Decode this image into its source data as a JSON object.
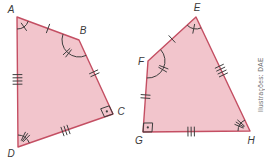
{
  "canvas": {
    "width": 265,
    "height": 164,
    "background": "#ffffff"
  },
  "credit": {
    "text": "Ilustrações: DAE"
  },
  "colors": {
    "shape_fill": "#f2c5cc",
    "shape_stroke": "#c44f63",
    "mark": "#3d3d3d",
    "label": "#3a3a3a",
    "credit": "#6b6b6b"
  },
  "shapes": [
    {
      "id": "quadrilateral-ABCD",
      "vertices": [
        {
          "label": "A",
          "x": 17,
          "y": 17,
          "lx": 11,
          "ly": 13
        },
        {
          "label": "B",
          "x": 79,
          "y": 40,
          "lx": 83,
          "ly": 34
        },
        {
          "label": "C",
          "x": 113,
          "y": 114,
          "lx": 121,
          "ly": 115
        },
        {
          "label": "D",
          "x": 18,
          "y": 147,
          "lx": 11,
          "ly": 157
        }
      ],
      "side_marks": [
        {
          "side": "AB",
          "from": 0,
          "to": 1,
          "ticks": 1,
          "t": 0.5
        },
        {
          "side": "BC",
          "from": 1,
          "to": 2,
          "ticks": 2,
          "t": 0.45
        },
        {
          "side": "CD",
          "from": 2,
          "to": 3,
          "ticks": 3,
          "t": 0.5
        },
        {
          "side": "DA",
          "from": 3,
          "to": 0,
          "ticks": 4,
          "t": 0.52
        }
      ],
      "angle_marks": [
        {
          "at": "A",
          "vertex": 0,
          "type": "arc",
          "radius": 12,
          "start": 20,
          "end": 90,
          "ticks": 1
        },
        {
          "at": "B",
          "vertex": 1,
          "type": "arc",
          "radius": 17,
          "start": 65,
          "end": 200,
          "ticks": 2
        },
        {
          "at": "C",
          "vertex": 2,
          "type": "right-angle",
          "size": 9,
          "dir1": 245,
          "dir2": 161
        },
        {
          "at": "D",
          "vertex": 3,
          "type": "arc",
          "radius": 12,
          "start": 270,
          "end": 341,
          "ticks": 3
        }
      ]
    },
    {
      "id": "quadrilateral-EFGH",
      "vertices": [
        {
          "label": "E",
          "x": 196,
          "y": 17,
          "lx": 197,
          "ly": 11
        },
        {
          "label": "F",
          "x": 148,
          "y": 61,
          "lx": 141,
          "ly": 65
        },
        {
          "label": "G",
          "x": 143,
          "y": 132,
          "lx": 139,
          "ly": 144
        },
        {
          "label": "H",
          "x": 250,
          "y": 131,
          "lx": 251,
          "ly": 144
        }
      ],
      "side_marks": [
        {
          "side": "EF",
          "from": 0,
          "to": 1,
          "ticks": 1,
          "t": 0.5
        },
        {
          "side": "FG",
          "from": 1,
          "to": 2,
          "ticks": 2,
          "t": 0.5
        },
        {
          "side": "GH",
          "from": 2,
          "to": 3,
          "ticks": 3,
          "t": 0.45
        },
        {
          "side": "EH",
          "from": 0,
          "to": 3,
          "ticks": 4,
          "t": 0.47
        }
      ],
      "angle_marks": [
        {
          "at": "E",
          "vertex": 0,
          "type": "arc",
          "radius": 12,
          "start": 65,
          "end": 137,
          "ticks": 1
        },
        {
          "at": "F",
          "vertex": 1,
          "type": "arc",
          "radius": 17,
          "start": -42,
          "end": 94,
          "ticks": 2
        },
        {
          "at": "G",
          "vertex": 2,
          "type": "right-angle",
          "size": 9,
          "dir1": 274,
          "dir2": 359.5
        },
        {
          "at": "H",
          "vertex": 3,
          "type": "arc",
          "radius": 12,
          "start": 180,
          "end": 245,
          "ticks": 3
        }
      ]
    }
  ]
}
